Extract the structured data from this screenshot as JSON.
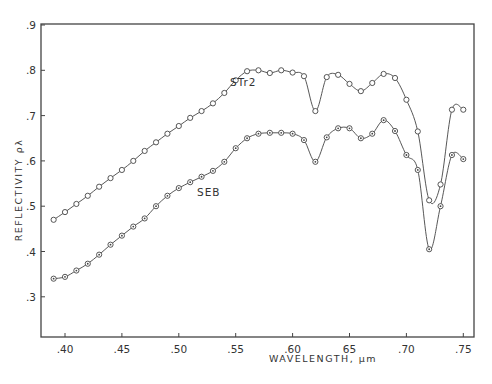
{
  "chart_data": {
    "type": "line",
    "title": "",
    "xlabel": "WAVELENGTH, μm",
    "ylabel": "REFLECTIVITY ρλ",
    "xlim": [
      0.385,
      0.76
    ],
    "ylim": [
      0.2,
      0.9
    ],
    "x_ticks": [
      0.4,
      0.45,
      0.5,
      0.55,
      0.6,
      0.65,
      0.7,
      0.75
    ],
    "x_tick_labels": [
      ".40",
      ".45",
      ".50",
      ".55",
      ".60",
      "65",
      ".70",
      ".75"
    ],
    "y_ticks": [
      0.3,
      0.4,
      0.5,
      0.6,
      0.7,
      0.8,
      0.9
    ],
    "y_tick_labels": [
      ".3",
      ".4",
      ".5",
      ".6",
      ".7",
      ".8",
      ".9"
    ],
    "grid": false,
    "legend": "inline labels",
    "x": [
      0.39,
      0.4,
      0.41,
      0.42,
      0.43,
      0.44,
      0.45,
      0.46,
      0.47,
      0.48,
      0.49,
      0.5,
      0.51,
      0.52,
      0.53,
      0.54,
      0.55,
      0.56,
      0.57,
      0.58,
      0.59,
      0.6,
      0.61,
      0.62,
      0.63,
      0.64,
      0.65,
      0.66,
      0.67,
      0.68,
      0.69,
      0.7,
      0.71,
      0.72,
      0.73,
      0.74,
      0.75
    ],
    "series": [
      {
        "name": "STr2",
        "marker": "open-circle",
        "label_pos": [
          0.545,
          0.765
        ],
        "values": [
          0.47,
          0.487,
          0.505,
          0.523,
          0.543,
          0.562,
          0.58,
          0.6,
          0.622,
          0.641,
          0.66,
          0.677,
          0.695,
          0.71,
          0.727,
          0.75,
          0.778,
          0.798,
          0.8,
          0.794,
          0.8,
          0.795,
          0.787,
          0.71,
          0.785,
          0.79,
          0.77,
          0.754,
          0.772,
          0.792,
          0.783,
          0.735,
          0.665,
          0.513,
          0.548,
          0.713,
          0.713
        ]
      },
      {
        "name": "SEB",
        "marker": "dotted-circle",
        "label_pos": [
          0.516,
          0.522
        ],
        "values": [
          0.34,
          0.344,
          0.358,
          0.373,
          0.393,
          0.415,
          0.435,
          0.455,
          0.473,
          0.5,
          0.523,
          0.54,
          0.553,
          0.565,
          0.578,
          0.598,
          0.628,
          0.65,
          0.66,
          0.662,
          0.662,
          0.66,
          0.646,
          0.598,
          0.652,
          0.672,
          0.672,
          0.65,
          0.66,
          0.69,
          0.666,
          0.613,
          0.58,
          0.405,
          0.5,
          0.613,
          0.604
        ]
      }
    ]
  },
  "colors": {
    "line": "#444444",
    "axis": "#333333",
    "background": "#ffffff"
  }
}
